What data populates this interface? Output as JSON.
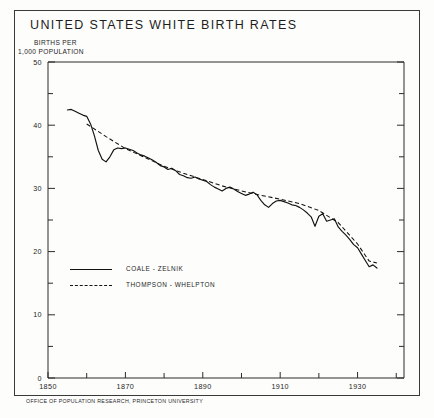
{
  "figure": {
    "title": "UNITED STATES WHITE BIRTH RATES",
    "ylabel_line1": "BIRTHS PER",
    "ylabel_line2": "1,000 POPULATION",
    "source_note": "OFFICE OF POPULATION RESEARCH, PRINCETON UNIVERSITY"
  },
  "legend": {
    "entries": [
      {
        "label": "COALE - ZELNIK",
        "style": "solid",
        "swatch_icon": "solid-line-icon"
      },
      {
        "label": "THOMPSON - WHELPTON",
        "style": "dashed",
        "swatch_icon": "dashed-line-icon"
      }
    ]
  },
  "axes": {
    "y_tick_labels": [
      "0",
      "10",
      "20",
      "30",
      "40",
      "50"
    ],
    "y_tick_values": [
      0,
      10,
      20,
      30,
      40,
      50
    ],
    "y_minor_values": [
      5,
      15,
      25,
      35,
      45
    ],
    "x_tick_labels": [
      "1850",
      "1870",
      "1890",
      "1910",
      "1930"
    ],
    "x_tick_values": [
      1850,
      1870,
      1890,
      1910,
      1930
    ],
    "x_minor_values": [
      1860,
      1880,
      1900,
      1920,
      1940
    ]
  },
  "chart_data": {
    "type": "line",
    "title": "UNITED STATES WHITE BIRTH RATES",
    "xlabel": "",
    "ylabel": "BIRTHS PER 1,000 POPULATION",
    "xlim": [
      1850,
      1942
    ],
    "ylim": [
      0,
      50
    ],
    "grid": false,
    "legend_position": "inside-lower-left",
    "series": [
      {
        "name": "COALE - ZELNIK",
        "style": "solid",
        "color": "#121212",
        "x": [
          1855,
          1856,
          1857,
          1858,
          1859,
          1860,
          1861,
          1862,
          1863,
          1864,
          1865,
          1866,
          1867,
          1868,
          1869,
          1870,
          1871,
          1872,
          1873,
          1874,
          1875,
          1876,
          1877,
          1878,
          1879,
          1880,
          1881,
          1882,
          1883,
          1884,
          1885,
          1886,
          1887,
          1888,
          1889,
          1890,
          1891,
          1892,
          1893,
          1894,
          1895,
          1896,
          1897,
          1898,
          1899,
          1900,
          1901,
          1902,
          1903,
          1904,
          1905,
          1906,
          1907,
          1908,
          1909,
          1910,
          1911,
          1912,
          1913,
          1914,
          1915,
          1916,
          1917,
          1918,
          1919,
          1920,
          1921,
          1922,
          1923,
          1924,
          1925,
          1926,
          1927,
          1928,
          1929,
          1930,
          1931,
          1932,
          1933,
          1934,
          1935
        ],
        "y": [
          42.4,
          42.5,
          42.2,
          41.9,
          41.6,
          41.4,
          40.2,
          38.3,
          36.0,
          34.6,
          34.2,
          35.0,
          36.1,
          36.4,
          36.3,
          36.4,
          36.2,
          36.0,
          35.6,
          35.3,
          35.1,
          34.8,
          34.5,
          34.1,
          33.6,
          33.4,
          33.0,
          33.2,
          32.8,
          32.2,
          32.0,
          31.7,
          31.6,
          31.8,
          31.5,
          31.3,
          31.1,
          30.6,
          30.2,
          29.9,
          29.6,
          30.0,
          30.2,
          29.9,
          29.5,
          29.2,
          28.9,
          29.1,
          29.4,
          29.0,
          28.1,
          27.4,
          27.0,
          27.6,
          28.0,
          28.1,
          27.9,
          27.7,
          27.4,
          27.3,
          27.0,
          26.6,
          26.1,
          25.5,
          24.0,
          25.6,
          26.0,
          24.8,
          25.0,
          25.2,
          23.9,
          23.2,
          22.6,
          21.9,
          21.1,
          20.6,
          19.6,
          18.6,
          17.6,
          17.9,
          17.4
        ]
      },
      {
        "name": "THOMPSON - WHELPTON",
        "style": "dashed",
        "color": "#121212",
        "x": [
          1860,
          1865,
          1870,
          1875,
          1880,
          1885,
          1890,
          1895,
          1900,
          1905,
          1910,
          1915,
          1920,
          1925,
          1930,
          1933,
          1935
        ],
        "y": [
          40.2,
          38.2,
          36.3,
          34.9,
          33.5,
          32.4,
          31.4,
          30.4,
          29.6,
          28.9,
          28.3,
          27.6,
          26.5,
          24.6,
          21.2,
          18.5,
          18.2
        ]
      }
    ]
  }
}
